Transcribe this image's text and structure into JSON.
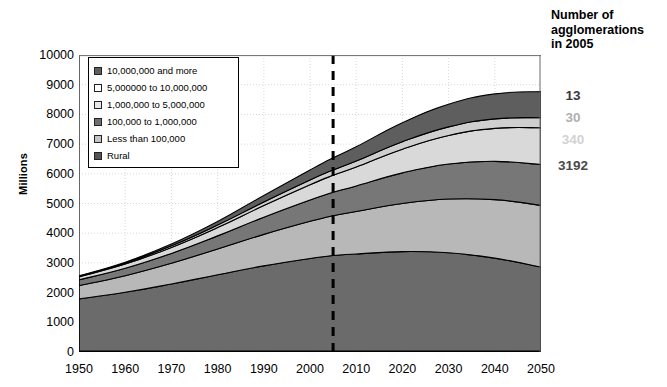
{
  "chart_data": {
    "type": "area",
    "title": "",
    "xlabel": "",
    "ylabel": "Millions",
    "xlim": [
      1950,
      2050
    ],
    "ylim": [
      0,
      10000
    ],
    "ytick_labels": [
      "10000",
      "9000",
      "8000",
      "7000",
      "6000",
      "5000",
      "4000",
      "3000",
      "2000",
      "1000",
      "0"
    ],
    "ytick_values": [
      10000,
      9000,
      8000,
      7000,
      6000,
      5000,
      4000,
      3000,
      2000,
      1000,
      0
    ],
    "xtick_labels": [
      "1950",
      "1960",
      "1970",
      "1980",
      "1990",
      "2000",
      "2010",
      "2020",
      "2030",
      "2040",
      "2050"
    ],
    "xtick_values": [
      1950,
      1960,
      1970,
      1980,
      1990,
      2000,
      2010,
      2020,
      2030,
      2040,
      2050
    ],
    "grid": true,
    "legend_position": "upper-left-inside",
    "stacking": "bottom-up",
    "x": [
      1950,
      1960,
      1970,
      1980,
      1990,
      2000,
      2005,
      2010,
      2020,
      2030,
      2040,
      2050
    ],
    "series": [
      {
        "name": "Rural",
        "color": "#6b6b6b",
        "values": [
          1790,
          2010,
          2290,
          2600,
          2900,
          3150,
          3250,
          3300,
          3380,
          3340,
          3160,
          2860
        ]
      },
      {
        "name": "Less than 100,000",
        "color": "#b8b8b8",
        "values": [
          450,
          560,
          700,
          870,
          1060,
          1250,
          1340,
          1430,
          1620,
          1810,
          1970,
          2080
        ]
      },
      {
        "name": "100,000 to 1,000,000",
        "color": "#777777",
        "values": [
          190,
          250,
          330,
          440,
          580,
          720,
          790,
          860,
          1030,
          1180,
          1290,
          1370
        ]
      },
      {
        "name": "1,000,000 to 5,000,000",
        "color": "#d9d9d9",
        "values": [
          100,
          140,
          200,
          280,
          390,
          510,
          570,
          640,
          800,
          960,
          1110,
          1240
        ]
      },
      {
        "name": "5,000,000 to 10,000,000",
        "color": "#cfcfcf",
        "values": [
          20,
          35,
          55,
          85,
          120,
          160,
          180,
          200,
          250,
          290,
          320,
          340
        ]
      },
      {
        "name": "10,000,000 and more",
        "color": "#5e5e5e",
        "values": [
          15,
          30,
          60,
          120,
          220,
          340,
          410,
          480,
          640,
          760,
          840,
          880
        ]
      }
    ],
    "totals": [
      2565,
      3025,
      3635,
      4395,
      5270,
      6130,
      6540,
      6910,
      7720,
      8340,
      8690,
      8770
    ],
    "marker_line": {
      "x": 2005,
      "style": "dashed",
      "color": "#000000",
      "width": 3
    }
  },
  "legend": {
    "items": [
      {
        "label": "10,000,000 and more",
        "swatch": "#5e5e5e"
      },
      {
        "label": "5,000000 to 10,000,000",
        "swatch": "#ffffff"
      },
      {
        "label": "1,000,000 to 5,000,000",
        "swatch": "#e8e8e8"
      },
      {
        "label": "100,000 to 1,000,000",
        "swatch": "#6e6e6e"
      },
      {
        "label": "Less than 100,000",
        "swatch": "#c4c4c4"
      },
      {
        "label": "Rural",
        "swatch": "#555555"
      }
    ]
  },
  "side_panel": {
    "heading_line1": "Number of",
    "heading_line2": "agglomerations",
    "heading_line3": "in 2005",
    "counts": [
      {
        "value": "13",
        "color": "#3a3a3a"
      },
      {
        "value": "30",
        "color": "#b0b0b0"
      },
      {
        "value": "340",
        "color": "#d2d2d2"
      },
      {
        "value": "3192",
        "color": "#4a4a4a"
      }
    ]
  }
}
